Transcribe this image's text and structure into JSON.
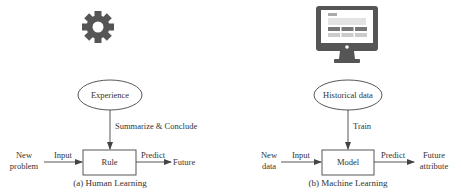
{
  "panels": [
    {
      "icon": "gear-icon",
      "source_label": "Experience",
      "process_label": "Summarize & Conclude",
      "input_source": [
        "New",
        "problem"
      ],
      "input_label": "Input",
      "center_label": "Rule",
      "output_label": "Predict",
      "output_target": [
        "Future"
      ],
      "caption": "(a) Human Learning"
    },
    {
      "icon": "monitor-icon",
      "source_label": "Historical data",
      "process_label": "Train",
      "input_source": [
        "New",
        "data"
      ],
      "input_label": "Input",
      "center_label": "Model",
      "output_label": "Predict",
      "output_target": [
        "Future",
        "attribute"
      ],
      "caption": "(b) Machine Learning"
    }
  ],
  "colors": {
    "icon": "#555555",
    "line": "#444444",
    "text": "#333333"
  }
}
